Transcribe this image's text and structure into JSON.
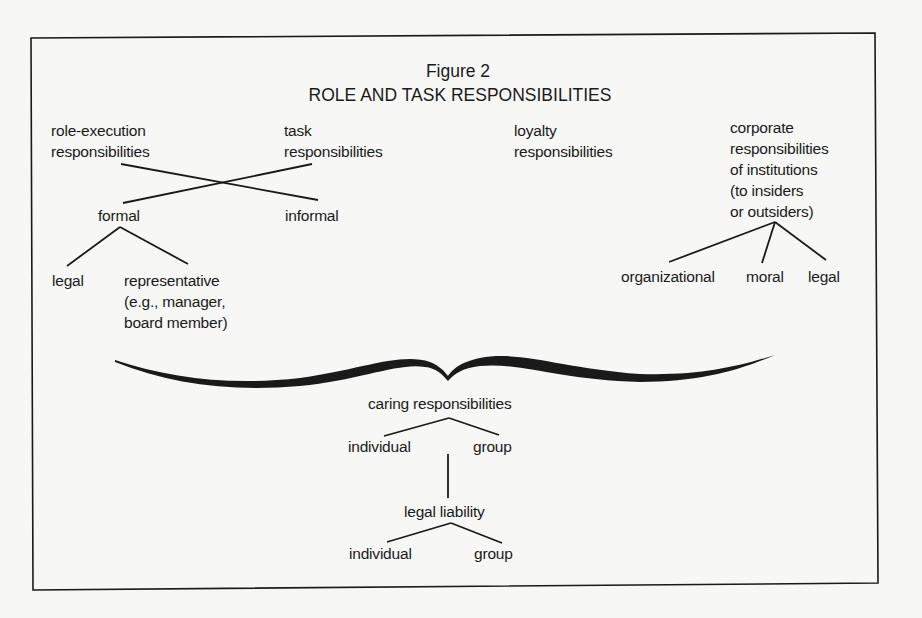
{
  "figure": {
    "number": "Figure 2",
    "title": "ROLE AND TASK RESPONSIBILITIES"
  },
  "top_nodes": {
    "role_execution": [
      "role-execution",
      "responsibilities"
    ],
    "task": [
      "task",
      "responsibilities"
    ],
    "loyalty": [
      "loyalty",
      "responsibilities"
    ],
    "corporate": [
      "corporate",
      "responsibilities",
      "of institutions",
      "(to insiders",
      "or outsiders)"
    ]
  },
  "cross_children": {
    "formal": "formal",
    "informal": "informal"
  },
  "formal_children": {
    "legal": "legal",
    "representative": [
      "representative",
      "(e.g., manager,",
      "board member)"
    ]
  },
  "corporate_children": {
    "organizational": "organizational",
    "moral": "moral",
    "legal": "legal"
  },
  "caring": {
    "label": "caring responsibilities",
    "individual": "individual",
    "group": "group"
  },
  "liability": {
    "label": "legal liability",
    "individual": "individual",
    "group": "group"
  },
  "colors": {
    "ink": "#1a1a1a",
    "paper": "#f7f7f5"
  }
}
